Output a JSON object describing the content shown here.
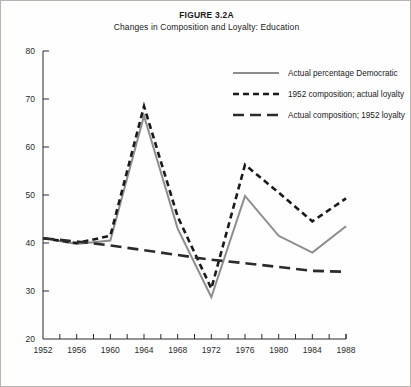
{
  "figure": {
    "title": "FIGURE 3.2A",
    "subtitle": "Changes in Composition and Loyalty: Education"
  },
  "chart_data": {
    "type": "line",
    "title": "FIGURE 3.2A",
    "subtitle": "Changes in Composition and Loyalty: Education",
    "xlabel": "",
    "ylabel": "",
    "xlim": [
      1952,
      1988
    ],
    "ylim": [
      20,
      80
    ],
    "grid": false,
    "legend_position": "top-right",
    "x_tick_labels": [
      "1952",
      "1956",
      "1960",
      "1964",
      "1968",
      "1972",
      "1976",
      "1980",
      "1984",
      "1988"
    ],
    "y_tick_labels": [
      "20",
      "30",
      "40",
      "50",
      "60",
      "70",
      "80"
    ],
    "x": [
      1952,
      1956,
      1960,
      1964,
      1968,
      1972,
      1976,
      1980,
      1984,
      1988
    ],
    "series": [
      {
        "name": "Actual percentage Democratic",
        "style": "solid",
        "color": "#8c8c8c",
        "values": [
          41.0,
          39.8,
          40.5,
          66.5,
          43.0,
          28.7,
          49.8,
          41.5,
          38.0,
          43.5
        ]
      },
      {
        "name": "1952 composition; actual loyalty",
        "style": "dotted-dash",
        "color": "#1a1a1a",
        "values": [
          41.0,
          40.0,
          41.5,
          68.5,
          45.5,
          30.5,
          56.3,
          50.5,
          44.5,
          49.3
        ]
      },
      {
        "name": "Actual composition; 1952 loyalty",
        "style": "long-dash",
        "color": "#2b2b2b",
        "values": [
          41.0,
          40.3,
          39.5,
          38.5,
          37.5,
          36.5,
          35.8,
          35.0,
          34.2,
          34.0
        ]
      }
    ]
  },
  "legend": {
    "items": [
      {
        "label": "Actual percentage Democratic"
      },
      {
        "label": "1952 composition; actual loyalty"
      },
      {
        "label": "Actual composition; 1952 loyalty"
      }
    ]
  }
}
